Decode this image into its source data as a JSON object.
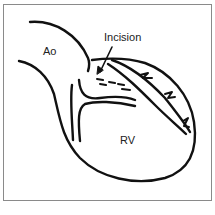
{
  "figure": {
    "labels": {
      "aorta": "Ao",
      "incision": "Incision",
      "right_ventricle": "RV"
    },
    "colors": {
      "stroke": "#111111",
      "frame": "#8a8a8a",
      "background": "#ffffff"
    }
  }
}
